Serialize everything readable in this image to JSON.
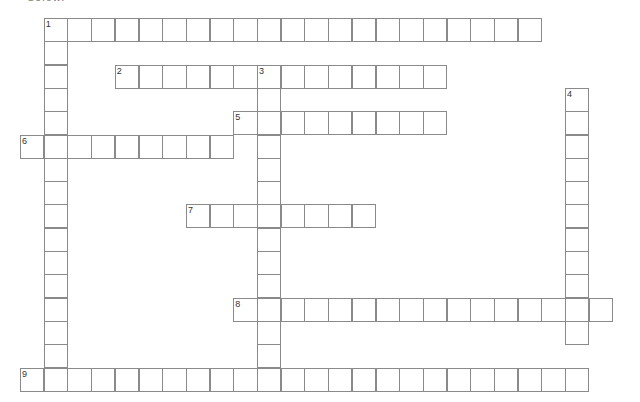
{
  "header": {
    "cut_off_text": "below."
  },
  "grid": {
    "origin_x": 20,
    "origin_y": 18,
    "cell_w": 23.7,
    "cell_h": 23.3,
    "line_color": "#8a8a8a"
  },
  "words": [
    {
      "number": "1",
      "direction": "across",
      "col": 1,
      "row": 0,
      "length": 21
    },
    {
      "number": "1",
      "direction": "down",
      "col": 1,
      "row": 0,
      "length": 16
    },
    {
      "number": "2",
      "direction": "across",
      "col": 4,
      "row": 2,
      "length": 14
    },
    {
      "number": "3",
      "direction": "down",
      "col": 10,
      "row": 2,
      "length": 14
    },
    {
      "number": "4",
      "direction": "down",
      "col": 23,
      "row": 3,
      "length": 11
    },
    {
      "number": "5",
      "direction": "across",
      "col": 9,
      "row": 4,
      "length": 9
    },
    {
      "number": "6",
      "direction": "across",
      "col": 0,
      "row": 5,
      "length": 9
    },
    {
      "number": "7",
      "direction": "across",
      "col": 7,
      "row": 8,
      "length": 8
    },
    {
      "number": "8",
      "direction": "across",
      "col": 9,
      "row": 12,
      "length": 16
    },
    {
      "number": "9",
      "direction": "across",
      "col": 0,
      "row": 15,
      "length": 24
    }
  ]
}
